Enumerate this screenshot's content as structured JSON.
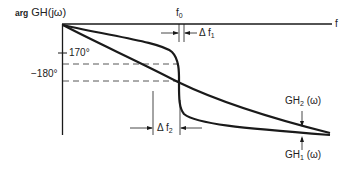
{
  "figure": {
    "type": "phase-frequency diagram",
    "y_axis_label": {
      "prefix": "arg",
      "main": "GH(jω)"
    },
    "x_axis_label": "f",
    "ticks": {
      "tick_170": "170°",
      "tick_180": "−180°"
    },
    "markers": {
      "f0": {
        "base": "f",
        "sub": "0"
      },
      "delta_f1": {
        "base": "Δ f",
        "sub": "1"
      },
      "delta_f2": {
        "base": "Δ f",
        "sub": "2"
      }
    },
    "curves": {
      "gh2": {
        "base": "GH",
        "sub": "2",
        "arg": " (ω)",
        "description": "gradual phase slope"
      },
      "gh1": {
        "base": "GH",
        "sub": "1",
        "arg": " (ω)",
        "description": "steep phase transition near f0"
      }
    },
    "colors": {
      "line": "#1a1a1a",
      "dashed": "#444444",
      "background": "#ffffff"
    }
  }
}
